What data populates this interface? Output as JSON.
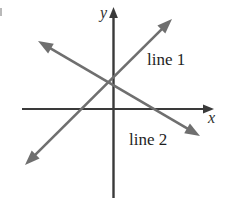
{
  "figure": {
    "background_color": "#ffffff",
    "width": 225,
    "height": 198,
    "axis_color": "#3a3a3a",
    "line_color": "#6f6f6f",
    "label_color": "#1e1e1e"
  },
  "axes": {
    "y_label": "y",
    "x_label": "x",
    "origin": {
      "x": 113,
      "y": 109
    },
    "x_axis": {
      "x_start": 22,
      "x_end": 214,
      "y": 109,
      "arrow_at": "right"
    },
    "y_axis": {
      "y_start": 7,
      "y_end": 198,
      "x": 113,
      "arrow_at": "top"
    },
    "ticks": [],
    "grid": false
  },
  "lines": [
    {
      "label": "line 1",
      "color": "#6f6f6f",
      "arrow_at": "both",
      "slope_sign": "positive",
      "start": {
        "x": 25,
        "y": 165
      },
      "end": {
        "x": 172,
        "y": 19
      }
    },
    {
      "label": "line 2",
      "color": "#6f6f6f",
      "arrow_at": "both",
      "slope_sign": "negative",
      "start": {
        "x": 38,
        "y": 41
      },
      "end": {
        "x": 200,
        "y": 136
      }
    }
  ],
  "chart_data": {
    "type": "line",
    "title": "",
    "xlabel": "x",
    "ylabel": "y",
    "grid": false,
    "legend": "inline-labels",
    "xlim": [
      -4.55,
      4.2
    ],
    "ylim": [
      -4.2,
      4.55
    ],
    "annotations": [
      {
        "text": "line 1",
        "x": 1.55,
        "y": 2.0
      },
      {
        "text": "line 2",
        "x": 0.95,
        "y": -1.45
      }
    ],
    "series": [
      {
        "name": "line 1",
        "type": "line",
        "arrows": "both-ends",
        "x": [
          -4.0,
          2.65
        ],
        "y": [
          -2.55,
          4.05
        ],
        "slope": 1.0,
        "intercept": 1.2
      },
      {
        "name": "line 2",
        "type": "line",
        "arrows": "both-ends",
        "x": [
          -3.4,
          3.9
        ],
        "y": [
          3.05,
          -1.2
        ],
        "slope": -0.59,
        "intercept": 1.2
      }
    ],
    "intersection": {
      "x": 0.0,
      "y": 1.2
    }
  }
}
